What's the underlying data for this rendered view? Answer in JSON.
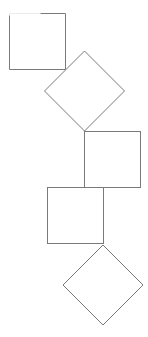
{
  "canvas": {
    "width": 148,
    "height": 337,
    "background": "#ffffff"
  },
  "style": {
    "stroke": "#7a7a7a",
    "faint_stroke": "#c8c8c8"
  },
  "shapes": [
    {
      "type": "square",
      "name": "square-1",
      "x": 9,
      "y": 13,
      "size": 56,
      "note": "top-left edge partially faint"
    },
    {
      "type": "diamond",
      "name": "diamond-1",
      "cx": 84.5,
      "cy": 91,
      "r": 40
    },
    {
      "type": "square",
      "name": "square-2",
      "x": 84,
      "y": 131,
      "size": 56
    },
    {
      "type": "square",
      "name": "square-3",
      "x": 47,
      "y": 187,
      "size": 56
    },
    {
      "type": "diamond",
      "name": "diamond-2",
      "cx": 103,
      "cy": 285,
      "r": 40
    }
  ]
}
